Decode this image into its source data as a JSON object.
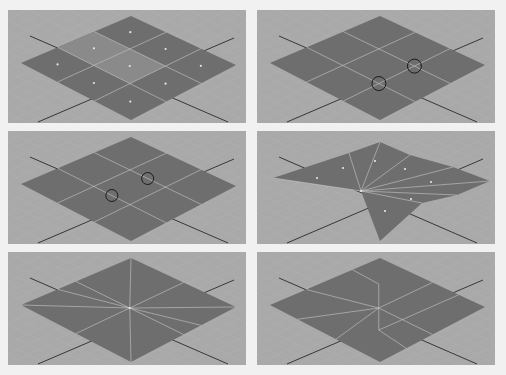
{
  "figure": {
    "colors": {
      "viewport_bg": "#a9a9a9",
      "grid_line": "#b4b4b4",
      "plane_face": "#6e6e6e",
      "selected_face": "#8a8a8a",
      "edge": "#c8c8c8",
      "axis": "#2a2a2a",
      "face_dot": "#e6e6e6",
      "marker": "#1a1a1a"
    },
    "panels": [
      {
        "id": "p1",
        "label": "3x3 plane with face centers, center faces selected",
        "grid": 3,
        "selected_faces": [
          4,
          3
        ],
        "face_centers": true
      },
      {
        "id": "p2",
        "label": "3x3 plane with two circled vertices",
        "grid": 3,
        "circled_vertices": 2
      },
      {
        "id": "p3",
        "label": "3x3 plane with two circled edge points",
        "grid": 3,
        "circled_points": 2
      },
      {
        "id": "p4",
        "label": "Plane split into triangular fan with corner pulled out",
        "faces": 8,
        "face_centers": true
      },
      {
        "id": "p5",
        "label": "Plane with 8 radial edges from center",
        "radial_edges": 8
      },
      {
        "id": "p6",
        "label": "Plane with radial edges merged to quads",
        "radial_edges": 6
      }
    ]
  }
}
